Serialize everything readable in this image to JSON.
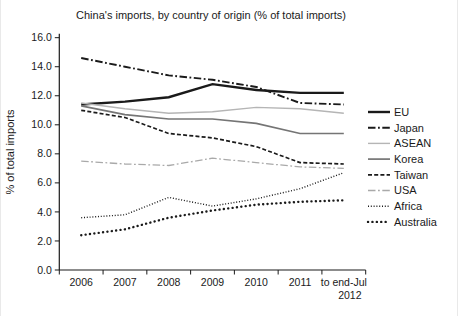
{
  "chart_data": {
    "type": "line",
    "title": "China's imports, by country of origin (% of total imports)",
    "ylabel": "% of total imports",
    "xlabel": "",
    "ylim": [
      0,
      16
    ],
    "ytick_labels": [
      "0.0",
      "2.0",
      "4.0",
      "6.0",
      "8.0",
      "10.0",
      "12.0",
      "14.0",
      "16.0"
    ],
    "categories": [
      "2006",
      "2007",
      "2008",
      "2009",
      "2010",
      "2011",
      "to end-Jul\n2012"
    ],
    "grid": false,
    "legend_position": "right",
    "series": [
      {
        "name": "EU",
        "values": [
          11.4,
          11.6,
          11.9,
          12.8,
          12.4,
          12.2,
          12.2
        ],
        "color": "#1a1a1a",
        "pattern": "solid",
        "width": 2.4
      },
      {
        "name": "Japan",
        "values": [
          14.6,
          14.0,
          13.4,
          13.1,
          12.6,
          11.5,
          11.4
        ],
        "color": "#1a1a1a",
        "pattern": "dash-dot",
        "width": 1.9
      },
      {
        "name": "ASEAN",
        "values": [
          11.5,
          11.1,
          10.8,
          10.9,
          11.2,
          11.1,
          10.8
        ],
        "color": "#b5b5b5",
        "pattern": "solid",
        "width": 1.4
      },
      {
        "name": "Korea",
        "values": [
          11.3,
          10.7,
          10.4,
          10.4,
          10.1,
          9.4,
          9.4
        ],
        "color": "#757575",
        "pattern": "solid",
        "width": 1.7
      },
      {
        "name": "Taiwan",
        "values": [
          11.0,
          10.5,
          9.4,
          9.1,
          8.5,
          7.4,
          7.3
        ],
        "color": "#1a1a1a",
        "pattern": "dashed",
        "width": 1.7
      },
      {
        "name": "USA",
        "values": [
          7.5,
          7.3,
          7.2,
          7.7,
          7.4,
          7.1,
          7.0
        ],
        "color": "#a9a9a9",
        "pattern": "dash-dot",
        "width": 1.3
      },
      {
        "name": "Africa",
        "values": [
          3.6,
          3.8,
          5.0,
          4.4,
          4.9,
          5.6,
          6.7
        ],
        "color": "#1a1a1a",
        "pattern": "fine-dotted",
        "width": 1.4
      },
      {
        "name": "Australia",
        "values": [
          2.4,
          2.8,
          3.6,
          4.1,
          4.5,
          4.7,
          4.8
        ],
        "color": "#1a1a1a",
        "pattern": "round-dotted",
        "width": 2.4
      }
    ]
  }
}
